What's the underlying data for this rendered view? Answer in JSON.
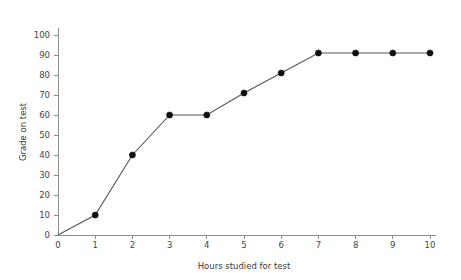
{
  "chart_data": {
    "type": "line",
    "title": "",
    "xlabel": "Hours studied for test",
    "ylabel": "Grade on test",
    "x": [
      0,
      1,
      2,
      3,
      4,
      5,
      6,
      7,
      8,
      9,
      10
    ],
    "values": [
      0,
      10,
      40,
      60,
      60,
      71,
      81,
      91,
      91,
      91,
      91
    ],
    "series": [
      {
        "name": "Grade on test",
        "x": [
          0,
          1,
          2,
          3,
          4,
          5,
          6,
          7,
          8,
          9,
          10
        ],
        "values": [
          0,
          10,
          40,
          60,
          60,
          71,
          81,
          91,
          91,
          91,
          91
        ]
      }
    ],
    "xlim": [
      0,
      10
    ],
    "ylim": [
      0,
      100
    ],
    "xticks": [
      "0",
      "1",
      "2",
      "3",
      "4",
      "5",
      "6",
      "7",
      "8",
      "9",
      "10"
    ],
    "yticks": [
      "0",
      "10",
      "20",
      "30",
      "40",
      "50",
      "60",
      "70",
      "80",
      "90",
      "100"
    ],
    "grid": false,
    "legend": false,
    "legend_position": "none",
    "marker": "filled-circle",
    "line_color": "#555555",
    "marker_color": "#111111",
    "axis_color": "#8c8c8c",
    "background_color": "#ffffff",
    "has_markers_at_origin": false
  },
  "axes": {
    "x_title": "Hours studied for test",
    "y_title": "Grade on test"
  }
}
